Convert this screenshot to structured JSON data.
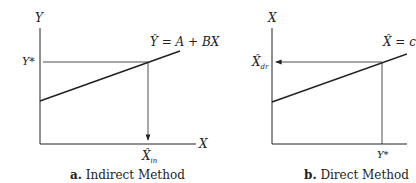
{
  "panel_a": {
    "y_axis_label": "Y",
    "x_axis_label": "X",
    "y_star_label": "Y*",
    "equation": "Ŷ = A + BX",
    "result_label": "X̂",
    "result_subscript": "in",
    "caption_letter": "a.",
    "caption_text": "Indirect Method"
  },
  "panel_b": {
    "y_axis_label": "X",
    "equation": "X̂ = c",
    "result_label": "X̂",
    "result_subscript": "dr",
    "y_star_label": "Y*",
    "caption_letter": "b.",
    "caption_text": "Direct Method"
  },
  "colors": {
    "line": "#222222",
    "background": "#ffffff"
  }
}
